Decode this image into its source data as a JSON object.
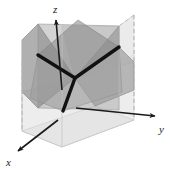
{
  "figure": {
    "title": "",
    "background_color": "#ffffff",
    "width": 170,
    "height": 169
  },
  "axes": {
    "z": {
      "label": "z",
      "direction": "up",
      "arrow": true,
      "origin": [
        62,
        147
      ],
      "tip": [
        56,
        18
      ],
      "label_position": [
        51,
        12
      ]
    },
    "y": {
      "label": "y",
      "direction": "right",
      "arrow": true,
      "origin": [
        62,
        118
      ],
      "tip": [
        157,
        117
      ],
      "label_position": [
        158,
        130
      ]
    },
    "x": {
      "label": "x",
      "direction": "down-left",
      "arrow": true,
      "origin": [
        62,
        118
      ],
      "tip": [
        16,
        152
      ],
      "label_position": [
        7,
        164
      ]
    },
    "color": "#1a1a1a"
  },
  "intersection_lines": {
    "center_vertex": [
      75,
      78
    ],
    "color": "#111111",
    "stroke_width": 3.2,
    "segments": [
      {
        "name": "upper-left-branch",
        "from": [
          75,
          78
        ],
        "to": [
          38,
          55
        ]
      },
      {
        "name": "upper-right-branch",
        "from": [
          75,
          78
        ],
        "to": [
          119,
          47
        ]
      },
      {
        "name": "lower-branch",
        "from": [
          75,
          78
        ],
        "to": [
          63,
          111
        ]
      }
    ]
  },
  "planes": [
    {
      "name": "plane-left-dark",
      "fill": "#8e8e8e",
      "opacity": 0.78
    },
    {
      "name": "plane-right-dark",
      "fill": "#9a9a9a",
      "opacity": 0.72
    },
    {
      "name": "plane-vertical-mid",
      "fill": "#a8a8a8",
      "opacity": 0.62
    },
    {
      "name": "plane-top-light",
      "fill": "#dcdcdc",
      "opacity": 0.7
    },
    {
      "name": "plane-bottom-light",
      "fill": "#e2e2e2",
      "opacity": 0.8
    },
    {
      "name": "box-bottom-face",
      "fill": "#ededed",
      "opacity": 0.95
    }
  ],
  "box": {
    "edge_color": "#b5b5b5",
    "dashed_edge_color": "#b0b0b0",
    "dash_pattern": "4,3",
    "dashed_edges": [
      {
        "name": "dashed-edge-left",
        "from": [
          22,
          62
        ],
        "to": [
          22,
          131
        ]
      },
      {
        "name": "dashed-edge-right",
        "from": [
          134,
          15
        ],
        "to": [
          134,
          120
        ]
      },
      {
        "name": "dashed-edge-top-right",
        "from": [
          134,
          15
        ],
        "to": [
          119,
          26
        ]
      }
    ]
  },
  "colors": {
    "ink": "#1a1a1a",
    "line": "#111111",
    "light_gray": "#e2e2e2",
    "mid_gray": "#a8a8a8",
    "dark_gray": "#8e8e8e",
    "background": "#ffffff"
  }
}
